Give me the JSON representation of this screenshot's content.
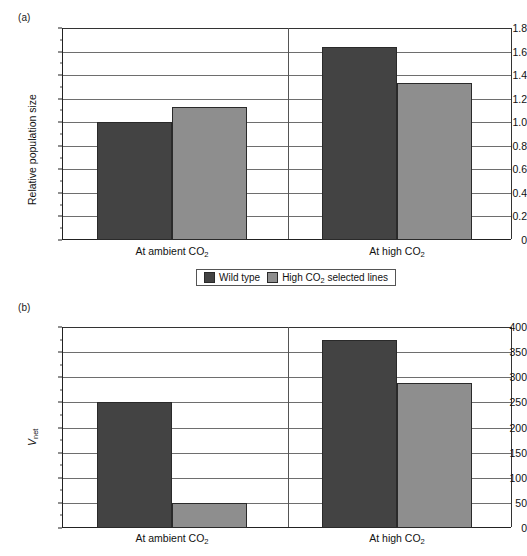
{
  "figure": {
    "panels": [
      {
        "id": "a",
        "label": "(a)",
        "ylabel": "Relative population size",
        "yticks": [
          "0",
          "0.2",
          "0.4",
          "0.6",
          "0.8",
          "1.0",
          "1.2",
          "1.4",
          "1.6",
          "1.8"
        ],
        "categories": [
          "At ambient CO",
          "At high CO"
        ],
        "cat_sub": "2"
      },
      {
        "id": "b",
        "label": "(b)",
        "ylabel_main": "V",
        "ylabel_sub": "net",
        "yticks": [
          "0",
          "50",
          "100",
          "150",
          "200",
          "250",
          "300",
          "350",
          "400"
        ],
        "categories": [
          "At ambient CO",
          "At high CO"
        ],
        "cat_sub": "2"
      }
    ],
    "legend": {
      "entries": [
        {
          "label": "Wild type",
          "label_sub": "",
          "label_tail": "",
          "color": "#434343"
        },
        {
          "label": "High CO",
          "label_sub": "2",
          "label_tail": " selected lines",
          "color": "#8e8e8e"
        }
      ]
    },
    "colors": {
      "wild_type": "#434343",
      "selected_lines": "#8e8e8e",
      "axis": "#222222",
      "gridline": "#6e6e6e",
      "background": "#ffffff"
    }
  },
  "chart_data": [
    {
      "type": "bar",
      "panel": "a",
      "title": "(a)",
      "xlabel": "",
      "ylabel": "Relative population size",
      "categories": [
        "At ambient CO2",
        "At high CO2"
      ],
      "series": [
        {
          "name": "Wild type",
          "values": [
            1.0,
            1.64
          ],
          "color": "#434343"
        },
        {
          "name": "High CO2 selected lines",
          "values": [
            1.13,
            1.33
          ],
          "color": "#8e8e8e"
        }
      ],
      "ylim": [
        0,
        1.8
      ],
      "ytick_step": 0.2,
      "yticks": [
        0,
        0.2,
        0.4,
        0.6,
        0.8,
        1.0,
        1.2,
        1.4,
        1.6,
        1.8
      ],
      "grid": true,
      "legend_position": "below"
    },
    {
      "type": "bar",
      "panel": "b",
      "title": "(b)",
      "xlabel": "",
      "ylabel": "Vnet",
      "categories": [
        "At ambient CO2",
        "At high CO2"
      ],
      "series": [
        {
          "name": "Wild type",
          "values": [
            250,
            375
          ],
          "color": "#434343"
        },
        {
          "name": "High CO2 selected lines",
          "values": [
            50,
            289
          ],
          "color": "#8e8e8e"
        }
      ],
      "ylim": [
        0,
        400
      ],
      "ytick_step": 50,
      "yticks": [
        0,
        50,
        100,
        150,
        200,
        250,
        300,
        350,
        400
      ],
      "grid": true,
      "legend_position": "shared-above"
    }
  ]
}
